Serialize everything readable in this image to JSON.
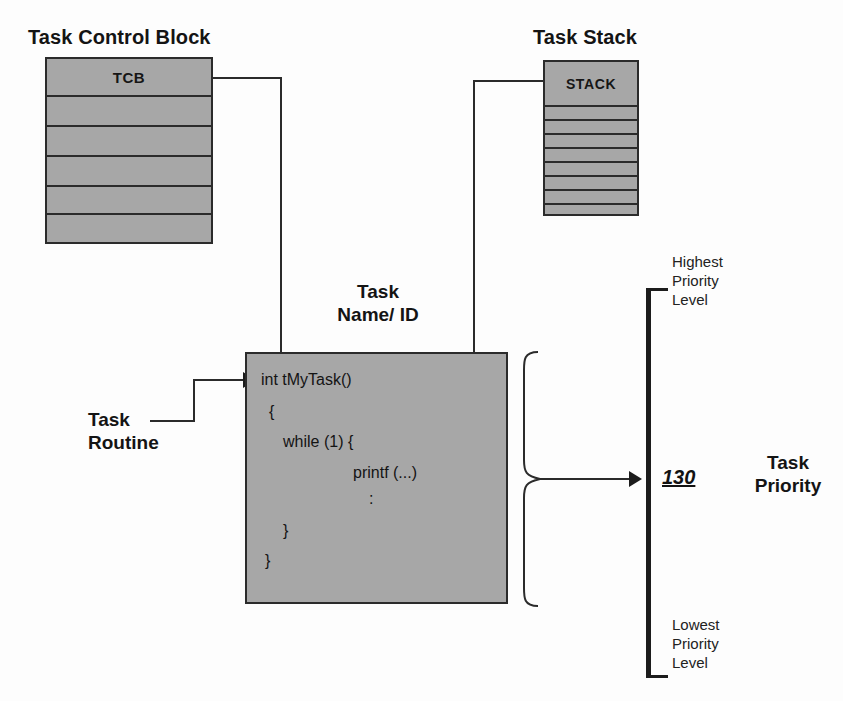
{
  "diagram": {
    "title_tcb": "Task Control Block",
    "title_stack": "Task Stack",
    "title_task": "Task\nName/ ID",
    "task_title_line1": "Task",
    "task_title_line2": "Name/ ID"
  },
  "tcb": {
    "label": "TCB",
    "row_count": 6
  },
  "stack": {
    "label": "STACK",
    "row_count": 9
  },
  "task_routine": {
    "line1": "Task",
    "line2": "Routine"
  },
  "code": {
    "lines": [
      "int tMyTask()",
      "{",
      "  while (1) {",
      "          printf (...)",
      "               :",
      "    }",
      "}"
    ],
    "line1": "int tMyTask()",
    "line2": "{",
    "line3": "while (1) {",
    "line4": "printf (...)",
    "line5": ":",
    "line6": "}",
    "line7": "}"
  },
  "priority": {
    "highest_l1": "Highest",
    "highest_l2": "Priority",
    "highest_l3": "Level",
    "lowest_l1": "Lowest",
    "lowest_l2": "Priority",
    "lowest_l3": "Level",
    "value": "130",
    "title_l1": "Task",
    "title_l2": "Priority"
  },
  "colors": {
    "block_fill": "#a7a7a7",
    "stroke": "#2b2b2b",
    "text": "#141414",
    "background": "#fdfdfd"
  }
}
